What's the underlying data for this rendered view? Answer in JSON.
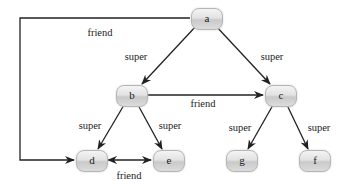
{
  "nodes": {
    "a": {
      "label": "a",
      "x": 206,
      "y": 18
    },
    "b": {
      "label": "b",
      "x": 131,
      "y": 95
    },
    "c": {
      "label": "c",
      "x": 280,
      "y": 95
    },
    "d": {
      "label": "d",
      "x": 91,
      "y": 160
    },
    "e": {
      "label": "e",
      "x": 168,
      "y": 160
    },
    "g": {
      "label": "g",
      "x": 241,
      "y": 160
    },
    "f": {
      "label": "f",
      "x": 314,
      "y": 160
    }
  },
  "edges": [
    {
      "from": "a",
      "to": "b",
      "label": "super"
    },
    {
      "from": "a",
      "to": "c",
      "label": "super"
    },
    {
      "from": "a",
      "to": "d",
      "label": "friend"
    },
    {
      "from": "b",
      "to": "c",
      "label": "friend"
    },
    {
      "from": "b",
      "to": "d",
      "label": "super"
    },
    {
      "from": "b",
      "to": "e",
      "label": "super"
    },
    {
      "from": "d",
      "to": "e",
      "label": "friend",
      "bidirectional": true
    },
    {
      "from": "c",
      "to": "g",
      "label": "super"
    },
    {
      "from": "c",
      "to": "f",
      "label": "super"
    }
  ],
  "edge_labels": {
    "a_b": "super",
    "a_c": "super",
    "a_d": "friend",
    "b_c": "friend",
    "b_d": "super",
    "b_e": "super",
    "d_e": "friend",
    "c_g": "super",
    "c_f": "super"
  },
  "colors": {
    "edge": "#222222",
    "node_border": "#b5b5b5"
  }
}
